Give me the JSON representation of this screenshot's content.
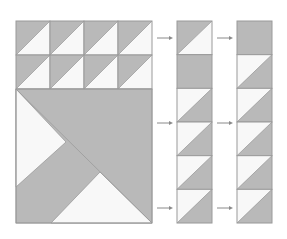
{
  "diagram": {
    "title": "Quilt block construction: half-square triangle units",
    "colors": {
      "gray": "#b9b9b9",
      "white": "#f8f8f8",
      "stroke": "#9a9a9a",
      "arrow": "#8a8a8a"
    },
    "left_block": {
      "x": 16,
      "y": 21,
      "width": 136,
      "height": 202,
      "hst_rows": 2,
      "hst_cols": 4,
      "unit": 34,
      "hst_orientation": "gray-top-left",
      "large_block": {
        "x": 16,
        "y": 89,
        "width": 136,
        "height": 134,
        "polygons": [
          {
            "name": "large-block-background",
            "fill": "gray",
            "points": "16,89 152,89 152,223 16,223"
          },
          {
            "name": "left-white-triangle",
            "fill": "white",
            "points": "16,89 66,142 16,187"
          },
          {
            "name": "bottom-white-triangle",
            "fill": "white",
            "points": "51,223 100,172 152,223"
          }
        ],
        "lines": [
          {
            "name": "main-diagonal",
            "x1": 16,
            "y1": 89,
            "x2": 152,
            "y2": 223
          }
        ]
      }
    },
    "strips": [
      {
        "name": "middle-strip",
        "x": 177,
        "y": 21,
        "width": 35,
        "unit": 33.67,
        "units": [
          "gray-top-left",
          "solid-gray",
          "white-top-left",
          "white-top-left",
          "white-top-left",
          "white-top-left"
        ]
      },
      {
        "name": "right-strip",
        "x": 237,
        "y": 21,
        "width": 35,
        "unit": 33.67,
        "units": [
          "solid-gray",
          "white-top-left",
          "white-top-left",
          "white-top-left",
          "white-top-left",
          "white-top-left"
        ]
      }
    ],
    "arrows": [
      {
        "x1": 157,
        "x2": 173,
        "y": 38
      },
      {
        "x1": 157,
        "x2": 173,
        "y": 123
      },
      {
        "x1": 157,
        "x2": 173,
        "y": 208
      },
      {
        "x1": 217,
        "x2": 233,
        "y": 38
      },
      {
        "x1": 217,
        "x2": 233,
        "y": 123
      },
      {
        "x1": 217,
        "x2": 233,
        "y": 208
      }
    ]
  }
}
